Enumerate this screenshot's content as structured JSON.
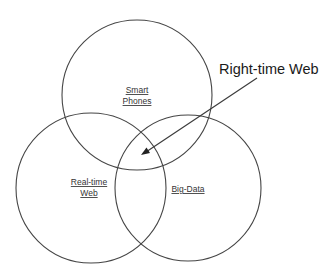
{
  "diagram": {
    "type": "venn",
    "sets": [
      {
        "id": "smart-phones",
        "label_lines": [
          "Smart",
          "Phones"
        ],
        "cx": 137,
        "cy": 95,
        "r": 75
      },
      {
        "id": "real-time-web",
        "label_lines": [
          "Real-time",
          "Web"
        ],
        "cx": 91,
        "cy": 188,
        "r": 75
      },
      {
        "id": "big-data",
        "label_lines": [
          "Big-Data"
        ],
        "cx": 188,
        "cy": 188,
        "r": 73
      }
    ],
    "callout": {
      "label": "Right-time Web",
      "points_to": "intersection of Smart Phones, Real-time Web, Big-Data"
    },
    "colors": {
      "stroke": "#454545",
      "text": "#333333",
      "background": "#ffffff"
    }
  }
}
